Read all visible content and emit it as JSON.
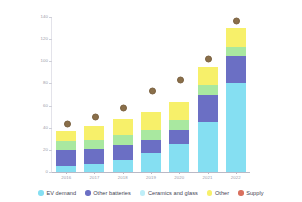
{
  "chart_data": {
    "type": "bar",
    "stacked": true,
    "title": "",
    "xlabel": "",
    "ylabel": "",
    "ylim": [
      0,
      140
    ],
    "yticks": [
      0,
      20,
      40,
      60,
      80,
      100,
      120,
      140
    ],
    "grid": false,
    "legend_position": "bottom",
    "categories": [
      "2016",
      "2017",
      "2018",
      "2019",
      "2020",
      "2021",
      "2022"
    ],
    "series": [
      {
        "name": "EV demand",
        "color": "#85dff2",
        "values": [
          5,
          7,
          11,
          17,
          25,
          45,
          80
        ]
      },
      {
        "name": "Other batteries",
        "color": "#6b6fc4",
        "values": [
          15,
          14,
          13,
          12,
          13,
          25,
          25
        ]
      },
      {
        "name": "Ceramics and glass",
        "color": "#a9e8a0",
        "values": [
          8,
          8,
          9,
          9,
          9,
          9,
          8
        ]
      },
      {
        "name": "Other",
        "color": "#f7f06a",
        "values": [
          9,
          13,
          15,
          16,
          16,
          16,
          17
        ]
      }
    ],
    "markers": {
      "name": "Supply",
      "color": "#8a6f4a",
      "values": [
        38,
        44,
        52,
        68,
        78,
        97,
        131
      ]
    },
    "totals": [
      37,
      42,
      48,
      54,
      63,
      95,
      130
    ]
  },
  "legend": {
    "items": [
      {
        "label": "EV demand",
        "color": "#85dff2"
      },
      {
        "label": "Other batteries",
        "color": "#6b6fc4"
      },
      {
        "label": "Ceramics and glass",
        "color": "#bfeef8"
      },
      {
        "label": "Other",
        "color": "#f7f06a"
      },
      {
        "label": "Supply",
        "color": "#d9705e"
      }
    ]
  },
  "axes": {
    "y_tick_labels": [
      "140",
      "120",
      "100",
      "80",
      "60",
      "40",
      "20",
      "0"
    ],
    "x_tick_labels": [
      "2016",
      "2017",
      "2018",
      "2019",
      "2020",
      "2021",
      "2022"
    ]
  }
}
